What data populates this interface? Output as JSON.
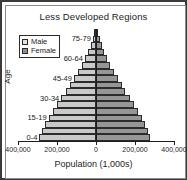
{
  "chart_data": {
    "type": "bar",
    "subtype": "population-pyramid",
    "title": "Less Developed Regions",
    "xlabel": "Population (1,000s)",
    "ylabel": "Age",
    "grid": false,
    "legend_position": "top-left",
    "xlim": [
      -400000,
      400000
    ],
    "xticks": [
      400000,
      200000,
      0,
      200000,
      400000
    ],
    "xtick_labels": [
      "400,000",
      "200,000",
      "0",
      "200,000",
      "400,000"
    ],
    "categories": [
      "0-4",
      "5-9",
      "10-14",
      "15-19",
      "20-24",
      "25-29",
      "30-34",
      "35-39",
      "40-44",
      "45-49",
      "50-54",
      "55-59",
      "60-64",
      "65-69",
      "70-74",
      "75-79",
      "80+"
    ],
    "ytick_labels": [
      "0-4",
      "15-19",
      "30-34",
      "45-49",
      "60-64",
      "75-79"
    ],
    "series": [
      {
        "name": "Male",
        "color": "#c9c9c9",
        "values": [
          290000,
          278000,
          262000,
          243000,
          222000,
          200000,
          178000,
          156000,
          134000,
          113000,
          93000,
          74000,
          57000,
          41000,
          27000,
          16000,
          8000
        ]
      },
      {
        "name": "Female",
        "color": "#969696",
        "values": [
          278000,
          267000,
          252000,
          234000,
          214000,
          193000,
          172000,
          151000,
          131000,
          111000,
          92000,
          74000,
          58000,
          43000,
          29000,
          18000,
          10000
        ]
      }
    ]
  },
  "chart": {
    "title": "Less Developed Regions",
    "x_axis_title": "Population (1,000s)",
    "y_axis_title": "Age",
    "legend": [
      {
        "label": "Male",
        "swatch": "male"
      },
      {
        "label": "Female",
        "swatch": "female"
      }
    ]
  }
}
